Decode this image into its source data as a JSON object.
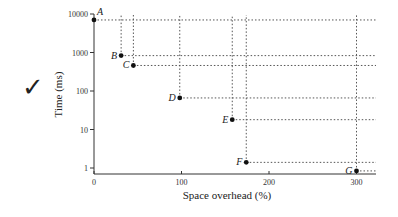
{
  "decoration": {
    "checkmark": "✓"
  },
  "chart_data": {
    "type": "scatter",
    "title": "",
    "xlabel": "Space overhead (%)",
    "ylabel": "Time (ms)",
    "xlim": [
      0,
      325
    ],
    "ylim": [
      0.7,
      10000
    ],
    "yscale": "log",
    "x_ticks": [
      0,
      100,
      200,
      300
    ],
    "x_tick_labels": [
      "0",
      "100",
      "200",
      "300"
    ],
    "y_ticks": [
      1,
      10,
      100,
      1000,
      10000
    ],
    "y_tick_labels": [
      "1",
      "10",
      "100",
      "1000",
      "10000"
    ],
    "grid": false,
    "guide_lines": "dotted lines from each point extending right and up",
    "points": [
      {
        "label": "A",
        "x": 0,
        "y": 7000
      },
      {
        "label": "B",
        "x": 31,
        "y": 830
      },
      {
        "label": "C",
        "x": 45,
        "y": 460
      },
      {
        "label": "D",
        "x": 98,
        "y": 66
      },
      {
        "label": "E",
        "x": 158,
        "y": 18
      },
      {
        "label": "F",
        "x": 174,
        "y": 1.4
      },
      {
        "label": "G",
        "x": 300,
        "y": 0.84
      }
    ]
  }
}
